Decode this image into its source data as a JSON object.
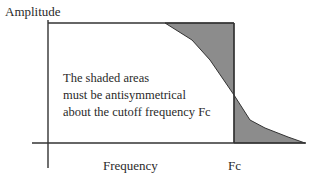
{
  "diagram": {
    "y_axis_label": "Amplitude",
    "x_axis_label": "Frequency",
    "cutoff_label": "Fc",
    "note_lines": [
      "The shaded areas",
      "must be antisymmetrical",
      "about the cutoff frequency Fc"
    ],
    "colors": {
      "line": "#333333",
      "shade": "#8c8c8c",
      "background": "#ffffff"
    }
  }
}
